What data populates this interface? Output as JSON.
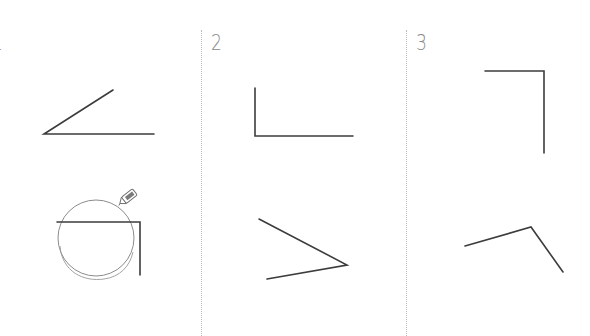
{
  "figure": {
    "panels": [
      {
        "label": "1",
        "angles": [
          {
            "name": "acute-angle",
            "points": [
              [
                113,
                90
              ],
              [
                44,
                134
              ],
              [
                154,
                134
              ]
            ]
          },
          {
            "name": "right-angle-with-compass",
            "points": [
              [
                57,
                222
              ],
              [
                140,
                222
              ],
              [
                140,
                275
              ]
            ],
            "compass_circle": {
              "cx": 96,
              "cy": 238,
              "r": 38
            },
            "pencil": true
          }
        ]
      },
      {
        "label": "2",
        "angles": [
          {
            "name": "right-angle",
            "points": [
              [
                255,
                88
              ],
              [
                255,
                136
              ],
              [
                353,
                136
              ]
            ]
          },
          {
            "name": "acute-angle",
            "points": [
              [
                259,
                219
              ],
              [
                347,
                265
              ],
              [
                267,
                279
              ]
            ]
          }
        ]
      },
      {
        "label": "3",
        "angles": [
          {
            "name": "right-angle",
            "points": [
              [
                485,
                71
              ],
              [
                544,
                71
              ],
              [
                544,
                153
              ]
            ]
          },
          {
            "name": "obtuse-angle",
            "points": [
              [
                465,
                246
              ],
              [
                531,
                227
              ],
              [
                563,
                272
              ]
            ]
          }
        ]
      }
    ],
    "dividers": [
      201,
      406
    ],
    "colors": {
      "line": "#3c3c3c",
      "divider": "#bdbdbd",
      "label": "#8a8a8a",
      "compass": "#8c8c8c"
    }
  }
}
